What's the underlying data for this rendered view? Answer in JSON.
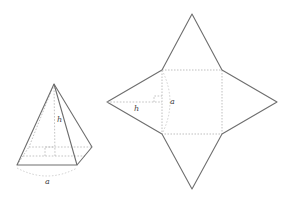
{
  "figure": {
    "pyramid": {
      "height_label": "h",
      "base_label": "a"
    },
    "net": {
      "height_label": "h",
      "side_label": "a"
    }
  },
  "colors": {
    "edge": "#6e6e6e",
    "hidden_edge": "#b4b4b4",
    "label": "#444444",
    "background": "#ffffff"
  }
}
